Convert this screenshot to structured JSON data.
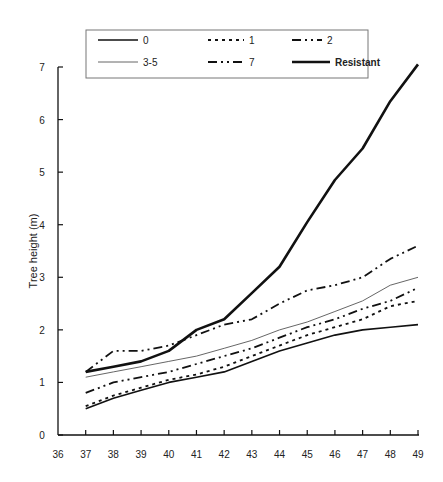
{
  "chart_data": {
    "type": "line",
    "title": "",
    "xlabel": "",
    "ylabel": "Tree height (m)",
    "xlim": [
      36,
      49
    ],
    "ylim": [
      0,
      7
    ],
    "x_ticks": [
      36,
      37,
      38,
      39,
      40,
      41,
      42,
      43,
      44,
      45,
      46,
      47,
      48,
      49
    ],
    "y_ticks": [
      0,
      1,
      2,
      3,
      4,
      5,
      6,
      7
    ],
    "grid": false,
    "legend_position": "top (boxed, 2 rows x 3 columns)",
    "x": [
      37,
      38,
      39,
      40,
      41,
      42,
      43,
      44,
      45,
      46,
      47,
      48,
      49
    ],
    "series": [
      {
        "name": "0",
        "style": "solid",
        "width": 1.6,
        "values": [
          0.5,
          0.7,
          0.85,
          1.0,
          1.1,
          1.2,
          1.4,
          1.6,
          1.75,
          1.9,
          2.0,
          2.05,
          2.1
        ]
      },
      {
        "name": "1",
        "style": "dotted",
        "width": 1.6,
        "values": [
          0.55,
          0.75,
          0.9,
          1.05,
          1.15,
          1.3,
          1.5,
          1.7,
          1.9,
          2.05,
          2.2,
          2.45,
          2.55
        ]
      },
      {
        "name": "2",
        "style": "dash-dot-dot",
        "width": 1.6,
        "values": [
          0.8,
          1.0,
          1.1,
          1.2,
          1.35,
          1.5,
          1.65,
          1.85,
          2.05,
          2.2,
          2.4,
          2.55,
          2.8
        ]
      },
      {
        "name": "3-5",
        "style": "thin-solid",
        "width": 0.8,
        "values": [
          1.1,
          1.2,
          1.3,
          1.4,
          1.5,
          1.65,
          1.8,
          2.0,
          2.15,
          2.35,
          2.55,
          2.85,
          3.0
        ]
      },
      {
        "name": "7",
        "style": "dash-dot-dot",
        "width": 1.6,
        "values": [
          1.2,
          1.6,
          1.6,
          1.7,
          1.9,
          2.1,
          2.2,
          2.5,
          2.75,
          2.85,
          3.0,
          3.35,
          3.6
        ]
      },
      {
        "name": "Resistant",
        "style": "thick-solid",
        "width": 2.6,
        "values": [
          1.2,
          1.3,
          1.4,
          1.6,
          2.0,
          2.2,
          2.7,
          3.2,
          4.05,
          4.85,
          5.45,
          6.35,
          7.05
        ]
      }
    ]
  },
  "legend": {
    "items": [
      {
        "label": "0"
      },
      {
        "label": "1"
      },
      {
        "label": "2"
      },
      {
        "label": "3-5"
      },
      {
        "label": "7"
      },
      {
        "label": "Resistant"
      }
    ]
  },
  "colors": {
    "line": "#111111",
    "thin_line": "#555555",
    "axis": "#111111",
    "background": "#ffffff"
  }
}
